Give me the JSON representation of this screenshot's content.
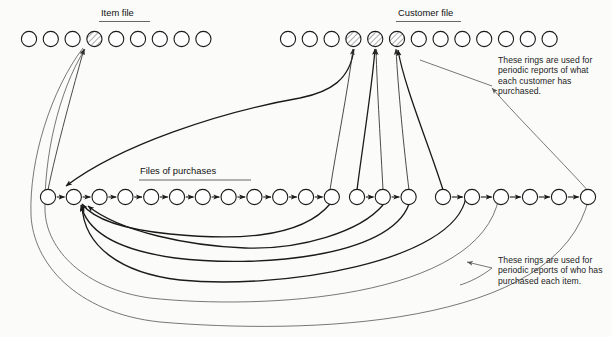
{
  "diagram": {
    "title_item_file": "Item file",
    "title_customer_file": "Customer file",
    "title_files_of_purchases": "Files of purchases",
    "note_customer": "These rings are used for periodic reports of what each customer has purchased.",
    "note_item": "These rings are used for periodic reports of who has purchased each item.",
    "colors": {
      "ink": "#1a1a1a",
      "paper": "#fbfbfa",
      "leader": "#555555",
      "hatch": "#7a7a7a"
    }
  },
  "chart_data": {
    "type": "diagram",
    "rows": [
      {
        "name": "item-file",
        "label": "Item file",
        "y": 39,
        "radius": 7.6,
        "count": 9,
        "x_start": 29,
        "x_step": 21.8,
        "hatched_indices": [
          3
        ]
      },
      {
        "name": "customer-file",
        "label": "Customer file",
        "y": 39,
        "radius": 7.6,
        "count": 13,
        "x_start": 288,
        "x_step": 21.8,
        "hatched_indices": [
          3,
          4,
          5
        ]
      },
      {
        "name": "files-of-purchases-group-1",
        "label": "Files of purchases",
        "y": 197,
        "radius": 7.6,
        "count": 12,
        "x_start": 48,
        "x_step": 25.8,
        "hatched_indices": []
      },
      {
        "name": "files-of-purchases-group-2",
        "label": "",
        "y": 197,
        "radius": 7.6,
        "count": 3,
        "x_start": 357,
        "x_step": 25.8,
        "hatched_indices": []
      },
      {
        "name": "files-of-purchases-group-3",
        "label": "",
        "y": 197,
        "radius": 7.6,
        "count": 6,
        "x_start": 443,
        "x_step": 29.0,
        "hatched_indices": []
      }
    ],
    "hatched_ring_count": 4,
    "annotations": [
      "These rings are used for periodic reports of what each customer has purchased.",
      "These rings are used for periodic reports of who has purchased each item."
    ]
  }
}
